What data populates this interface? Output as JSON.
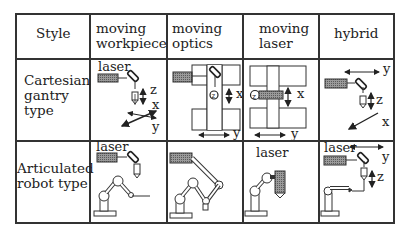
{
  "table": {
    "columns": [
      {
        "label": "Style"
      },
      {
        "label_line1": "moving",
        "label_line2": "workpiece"
      },
      {
        "label_line1": "moving",
        "label_line2": "optics"
      },
      {
        "label_line1": "moving",
        "label_line2": "laser"
      },
      {
        "label": "hybrid"
      }
    ],
    "rows": [
      {
        "label_line1": "Cartesian",
        "label_line2": "gantry",
        "label_line3": "type"
      },
      {
        "label_line1": "Articulated",
        "label_line2": "robot type"
      }
    ]
  },
  "diagram_labels": {
    "laser": "laser",
    "axis_x": "x",
    "axis_y": "y",
    "axis_z": "z"
  },
  "colors": {
    "line": "#333333",
    "laser_fill": "#888888"
  }
}
